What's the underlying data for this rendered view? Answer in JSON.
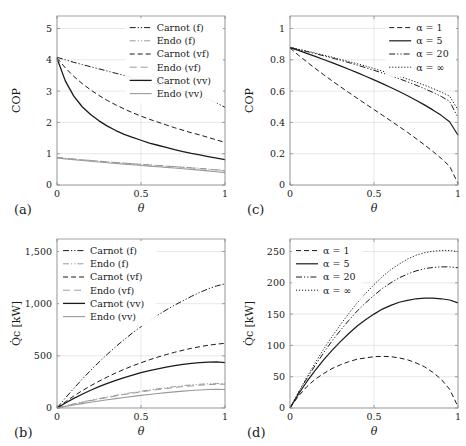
{
  "figure": {
    "width": 466,
    "height": 446,
    "background": "#ffffff",
    "axis_color": "#8c8c8c",
    "grid_color": "#d9d9d9"
  },
  "chart_data": [
    {
      "id": "panel-a",
      "type": "line",
      "panel_label": "(a)",
      "title": "",
      "xlabel": "θ",
      "ylabel": "COP",
      "xlim": [
        0,
        1
      ],
      "ylim": [
        0,
        5.4
      ],
      "xticks": [
        0,
        0.5,
        1
      ],
      "xticklabels": [
        "0",
        "0.5",
        "1"
      ],
      "yticks": [
        0,
        1,
        2,
        3,
        4,
        5
      ],
      "yticklabels": [
        "0",
        "1",
        "2",
        "3",
        "4",
        "5"
      ],
      "grid": true,
      "legend_position": "top-right",
      "x": [
        0,
        0.05,
        0.1,
        0.15,
        0.2,
        0.25,
        0.3,
        0.35,
        0.4,
        0.45,
        0.5,
        0.55,
        0.6,
        0.65,
        0.7,
        0.75,
        0.8,
        0.85,
        0.9,
        0.95,
        1
      ],
      "series": [
        {
          "name": "Carnot (f)",
          "style": "dashdotdot",
          "color": "#1a1a1a",
          "width": 1.0,
          "values": [
            4.08,
            4.0,
            3.92,
            3.85,
            3.78,
            3.71,
            3.64,
            3.57,
            3.5,
            3.43,
            3.36,
            3.29,
            3.22,
            3.15,
            3.08,
            3.0,
            2.92,
            2.84,
            2.74,
            2.62,
            2.48
          ]
        },
        {
          "name": "Endo (f)",
          "style": "dashdotdot",
          "color": "#9a9a9a",
          "width": 1.0,
          "values": [
            0.88,
            0.855,
            0.83,
            0.807,
            0.785,
            0.763,
            0.742,
            0.722,
            0.702,
            0.683,
            0.664,
            0.645,
            0.627,
            0.609,
            0.59,
            0.571,
            0.552,
            0.532,
            0.51,
            0.486,
            0.46
          ]
        },
        {
          "name": "Carnot (vf)",
          "style": "dashed",
          "color": "#1a1a1a",
          "width": 1.0,
          "values": [
            4.06,
            3.74,
            3.47,
            3.24,
            3.04,
            2.86,
            2.7,
            2.56,
            2.43,
            2.31,
            2.2,
            2.1,
            2.01,
            1.92,
            1.83,
            1.75,
            1.67,
            1.6,
            1.52,
            1.44,
            1.36
          ]
        },
        {
          "name": "Endo (vf)",
          "style": "longdash",
          "color": "#9a9a9a",
          "width": 1.0,
          "values": [
            0.875,
            0.85,
            0.825,
            0.802,
            0.78,
            0.758,
            0.737,
            0.717,
            0.697,
            0.677,
            0.658,
            0.639,
            0.62,
            0.602,
            0.583,
            0.564,
            0.545,
            0.524,
            0.502,
            0.478,
            0.45
          ]
        },
        {
          "name": "Carnot (vv)",
          "style": "solid",
          "color": "#1a1a1a",
          "width": 1.3,
          "values": [
            4.05,
            3.32,
            2.84,
            2.5,
            2.25,
            2.05,
            1.88,
            1.74,
            1.62,
            1.52,
            1.43,
            1.34,
            1.27,
            1.2,
            1.13,
            1.07,
            1.01,
            0.96,
            0.91,
            0.86,
            0.81
          ]
        },
        {
          "name": "Endo (vv)",
          "style": "solid",
          "color": "#9a9a9a",
          "width": 1.1,
          "values": [
            0.865,
            0.835,
            0.808,
            0.782,
            0.757,
            0.733,
            0.71,
            0.688,
            0.666,
            0.645,
            0.624,
            0.603,
            0.583,
            0.562,
            0.541,
            0.52,
            0.498,
            0.475,
            0.451,
            0.425,
            0.396
          ]
        }
      ]
    },
    {
      "id": "panel-b",
      "type": "line",
      "panel_label": "(b)",
      "title": "",
      "xlabel": "θ",
      "ylabel": "Q̇c [kW]",
      "xlim": [
        0,
        1
      ],
      "ylim": [
        0,
        1620
      ],
      "xticks": [
        0,
        0.5,
        1
      ],
      "xticklabels": [
        "0",
        "0.5",
        "1"
      ],
      "yticks": [
        0,
        500,
        1000,
        1500
      ],
      "yticklabels": [
        "0",
        "500",
        "1,000",
        "1,500"
      ],
      "grid": true,
      "legend_position": "top-left",
      "x": [
        0,
        0.05,
        0.1,
        0.15,
        0.2,
        0.25,
        0.3,
        0.35,
        0.4,
        0.45,
        0.5,
        0.55,
        0.6,
        0.65,
        0.7,
        0.75,
        0.8,
        0.85,
        0.9,
        0.95,
        1
      ],
      "series": [
        {
          "name": "Carnot (f)",
          "style": "dashdotdot",
          "color": "#1a1a1a",
          "width": 1.0,
          "values": [
            0,
            96,
            188,
            276,
            360,
            440,
            516,
            588,
            656,
            720,
            780,
            836,
            890,
            940,
            986,
            1028,
            1070,
            1108,
            1142,
            1170,
            1190
          ]
        },
        {
          "name": "Endo (f)",
          "style": "dashdotdot",
          "color": "#9a9a9a",
          "width": 1.0,
          "values": [
            0,
            20,
            39,
            57,
            74,
            90,
            106,
            121,
            135,
            148,
            161,
            173,
            184,
            195,
            205,
            214,
            222,
            228,
            232,
            234,
            232
          ]
        },
        {
          "name": "Carnot (vf)",
          "style": "dashed",
          "color": "#1a1a1a",
          "width": 1.0,
          "values": [
            0,
            60,
            115,
            166,
            213,
            257,
            298,
            336,
            371,
            404,
            434,
            462,
            488,
            512,
            534,
            554,
            572,
            588,
            601,
            612,
            620
          ]
        },
        {
          "name": "Endo (vf)",
          "style": "longdash",
          "color": "#9a9a9a",
          "width": 1.0,
          "values": [
            0,
            19,
            37,
            54,
            70,
            86,
            101,
            115,
            129,
            142,
            154,
            166,
            177,
            187,
            196,
            205,
            212,
            219,
            224,
            228,
            228
          ]
        },
        {
          "name": "Carnot (vv)",
          "style": "solid",
          "color": "#1a1a1a",
          "width": 1.3,
          "values": [
            0,
            48,
            92,
            132,
            170,
            204,
            236,
            265,
            292,
            316,
            338,
            358,
            376,
            392,
            406,
            418,
            428,
            435,
            440,
            442,
            435
          ]
        },
        {
          "name": "Endo (vv)",
          "style": "solid",
          "color": "#9a9a9a",
          "width": 1.1,
          "values": [
            0,
            15,
            29,
            42,
            55,
            67,
            79,
            90,
            101,
            111,
            121,
            130,
            139,
            147,
            155,
            162,
            168,
            173,
            177,
            180,
            178
          ]
        }
      ]
    },
    {
      "id": "panel-c",
      "type": "line",
      "panel_label": "(c)",
      "title": "",
      "xlabel": "θ",
      "ylabel": "COP",
      "xlim": [
        0,
        1
      ],
      "ylim": [
        0,
        1.08
      ],
      "xticks": [
        0,
        0.5,
        1
      ],
      "xticklabels": [
        "0",
        "0.5",
        "1"
      ],
      "yticks": [
        0,
        0.2,
        0.4,
        0.6,
        0.8,
        1
      ],
      "yticklabels": [
        "0",
        "0.2",
        "0.4",
        "0.6",
        "0.8",
        "1"
      ],
      "grid": true,
      "legend_position": "top-right",
      "x": [
        0,
        0.05,
        0.1,
        0.15,
        0.2,
        0.25,
        0.3,
        0.35,
        0.4,
        0.45,
        0.5,
        0.55,
        0.6,
        0.65,
        0.7,
        0.75,
        0.8,
        0.85,
        0.9,
        0.95,
        1
      ],
      "series": [
        {
          "name": "α = 1",
          "style": "dashed",
          "color": "#1a1a1a",
          "width": 1.0,
          "values": [
            0.876,
            0.83,
            0.787,
            0.745,
            0.705,
            0.666,
            0.628,
            0.591,
            0.554,
            0.518,
            0.482,
            0.446,
            0.41,
            0.373,
            0.336,
            0.297,
            0.257,
            0.215,
            0.17,
            0.12,
            0.01
          ]
        },
        {
          "name": "α = 5",
          "style": "solid",
          "color": "#1a1a1a",
          "width": 1.2,
          "values": [
            0.878,
            0.86,
            0.841,
            0.822,
            0.802,
            0.782,
            0.761,
            0.74,
            0.718,
            0.695,
            0.672,
            0.648,
            0.623,
            0.597,
            0.57,
            0.542,
            0.512,
            0.48,
            0.445,
            0.404,
            0.318
          ]
        },
        {
          "name": "α = 20",
          "style": "dashdotdot",
          "color": "#1a1a1a",
          "width": 1.0,
          "values": [
            0.879,
            0.866,
            0.853,
            0.84,
            0.826,
            0.812,
            0.797,
            0.782,
            0.766,
            0.75,
            0.733,
            0.716,
            0.698,
            0.679,
            0.659,
            0.638,
            0.616,
            0.592,
            0.566,
            0.535,
            0.43
          ]
        },
        {
          "name": "α = ∞",
          "style": "dotted",
          "color": "#1a1a1a",
          "width": 1.0,
          "values": [
            0.88,
            0.868,
            0.856,
            0.843,
            0.83,
            0.817,
            0.803,
            0.789,
            0.775,
            0.76,
            0.744,
            0.728,
            0.712,
            0.695,
            0.677,
            0.658,
            0.638,
            0.617,
            0.594,
            0.568,
            0.48
          ]
        }
      ]
    },
    {
      "id": "panel-d",
      "type": "line",
      "panel_label": "(d)",
      "title": "",
      "xlabel": "θ",
      "ylabel": "Q̇c [kW]",
      "xlim": [
        0,
        1
      ],
      "ylim": [
        0,
        270
      ],
      "xticks": [
        0,
        0.5,
        1
      ],
      "xticklabels": [
        "0",
        "0.5",
        "1"
      ],
      "yticks": [
        0,
        50,
        100,
        150,
        200,
        250
      ],
      "yticklabels": [
        "0",
        "50",
        "100",
        "150",
        "200",
        "250"
      ],
      "grid": true,
      "legend_position": "top-left",
      "x": [
        0,
        0.05,
        0.1,
        0.15,
        0.2,
        0.25,
        0.3,
        0.35,
        0.4,
        0.45,
        0.5,
        0.55,
        0.6,
        0.65,
        0.7,
        0.75,
        0.8,
        0.85,
        0.9,
        0.95,
        1
      ],
      "series": [
        {
          "name": "α = 1",
          "style": "dashed",
          "color": "#1a1a1a",
          "width": 1.0,
          "values": [
            0,
            19,
            34,
            46,
            55,
            63,
            69,
            74,
            78,
            80,
            82,
            82.5,
            82,
            80,
            77,
            72,
            66,
            57,
            46,
            30,
            2
          ]
        },
        {
          "name": "α = 5",
          "style": "solid",
          "color": "#1a1a1a",
          "width": 1.2,
          "values": [
            0,
            22,
            42,
            60,
            77,
            92,
            106,
            119,
            131,
            141,
            150,
            158,
            164,
            169,
            172,
            174.5,
            175.5,
            175.5,
            174.5,
            172.5,
            168
          ]
        },
        {
          "name": "α = 20",
          "style": "dashdotdot",
          "color": "#1a1a1a",
          "width": 1.0,
          "values": [
            0,
            24,
            47,
            68,
            88,
            107,
            124,
            140,
            155,
            168,
            180,
            191,
            200,
            208,
            214,
            219,
            222.5,
            224.5,
            225.5,
            225.5,
            224
          ]
        },
        {
          "name": "α = ∞",
          "style": "dotted",
          "color": "#1a1a1a",
          "width": 1.0,
          "values": [
            0,
            25,
            49,
            72,
            94,
            114,
            133,
            151,
            168,
            183,
            197,
            210,
            221,
            230,
            238,
            244,
            248,
            250.5,
            251.5,
            251.5,
            250
          ]
        }
      ]
    }
  ]
}
